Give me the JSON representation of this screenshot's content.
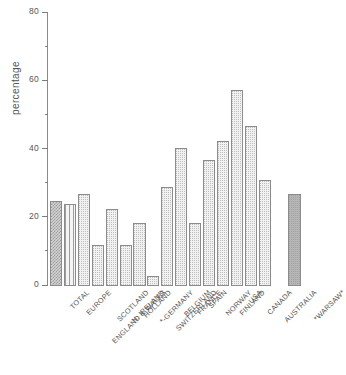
{
  "chart_data": {
    "type": "bar",
    "title": "",
    "xlabel": "",
    "ylabel": "percentage",
    "ylim": [
      0,
      80
    ],
    "yticks": [
      0,
      20,
      40,
      60,
      80
    ],
    "yticklabels": [
      "0",
      "20",
      "40",
      "60",
      "80"
    ],
    "minor_yticks": [
      10,
      30,
      50,
      70
    ],
    "grid": false,
    "legend": "none",
    "categories": [
      "TOTAL",
      "EUROPE",
      "ENGLAND & WALES",
      "SCOTLAND",
      "N. IRELAND",
      "HOLLAND",
      "*-GERMANY",
      "SWITZERLAND",
      "BELGIUM",
      "FRANCE",
      "SPAIN",
      "NORWAY",
      "FINLAND",
      "USA",
      "CANADA",
      "AUSTRALIA",
      "*WARSAW*"
    ],
    "values": [
      25,
      24,
      27,
      12,
      22.5,
      12,
      18.5,
      3,
      29,
      40.5,
      18.5,
      37,
      42.5,
      57.5,
      47,
      31,
      27
    ],
    "bar_styles": [
      "fill-cross",
      "fill-vstripe",
      "fill-dots",
      "fill-dots",
      "fill-dots",
      "fill-dots",
      "fill-dots",
      "fill-dots",
      "fill-dots",
      "fill-dots",
      "fill-dots",
      "fill-dots",
      "fill-dots",
      "fill-dots",
      "fill-dots",
      "fill-dots",
      "fill-solid"
    ],
    "gap_after_index": 15,
    "colors": {
      "axis": "#8a8a8a",
      "text": "#4f4f4f",
      "bar_edge": "#8c8c8c",
      "bar_light": "#f2f2f2",
      "bar_dark": "#b6b6b6"
    }
  }
}
